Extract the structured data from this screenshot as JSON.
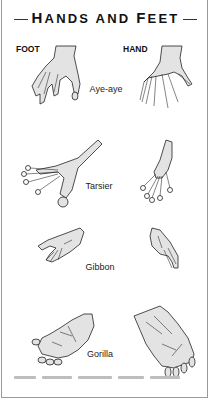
{
  "title": {
    "prefix_big": "H",
    "prefix_rest": "ANDS AND ",
    "suffix_big": "F",
    "suffix_rest": "EET",
    "full": "Hands and Feet"
  },
  "columns": {
    "left": "FOOT",
    "right": "HAND"
  },
  "species": [
    {
      "name": "Aye-aye",
      "foot_icon": "aye-aye-foot-illustration",
      "hand_icon": "aye-aye-hand-illustration"
    },
    {
      "name": "Tarsier",
      "foot_icon": "tarsier-foot-illustration",
      "hand_icon": "tarsier-hand-illustration"
    },
    {
      "name": "Gibbon",
      "foot_icon": "gibbon-foot-illustration",
      "hand_icon": "gibbon-hand-illustration"
    },
    {
      "name": "Gorilla",
      "foot_icon": "gorilla-foot-illustration",
      "hand_icon": "gorilla-hand-illustration"
    }
  ],
  "colors": {
    "ink": "#111111",
    "fill": "#e3e3e3",
    "border": "#9a9a9a"
  }
}
